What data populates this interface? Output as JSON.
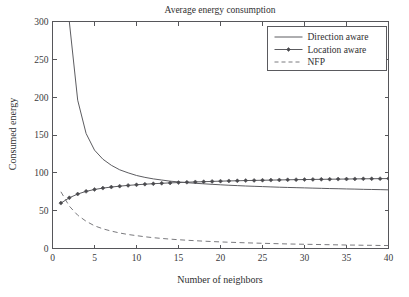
{
  "chart_data": {
    "type": "line",
    "title": "Average energy consumption",
    "xlabel": "Number of neighbors",
    "ylabel": "Consumed energy",
    "xlim": [
      0,
      40
    ],
    "ylim": [
      0,
      300
    ],
    "xticks": [
      0,
      5,
      10,
      15,
      20,
      25,
      30,
      35,
      40
    ],
    "yticks": [
      0,
      50,
      100,
      150,
      200,
      250,
      300
    ],
    "grid": false,
    "legend_position": "top-right",
    "x": [
      1,
      2,
      3,
      4,
      5,
      6,
      7,
      8,
      9,
      10,
      11,
      12,
      13,
      14,
      15,
      16,
      17,
      18,
      19,
      20,
      21,
      22,
      23,
      24,
      25,
      26,
      27,
      28,
      29,
      30,
      31,
      32,
      33,
      34,
      35,
      36,
      37,
      38,
      39,
      40
    ],
    "series": [
      {
        "name": "Direction aware",
        "style": "solid",
        "marker": "none",
        "color": "#5c5c60",
        "values": [
          600,
          300,
          196,
          152,
          130,
          118,
          110,
          104,
          100,
          96.5,
          94,
          92,
          90.5,
          89,
          88,
          87,
          86.2,
          85.5,
          84.8,
          84.2,
          83.6,
          83.1,
          82.6,
          82.2,
          81.8,
          81.4,
          81.0,
          80.7,
          80.4,
          80.1,
          79.8,
          79.5,
          79.2,
          79.0,
          78.7,
          78.5,
          78.2,
          78.0,
          77.8,
          77.5
        ]
      },
      {
        "name": "Location aware",
        "style": "solid",
        "marker": "diamond",
        "color": "#4a4a4e",
        "values": [
          60,
          67,
          72,
          75.5,
          78,
          79.8,
          81.2,
          82.4,
          83.4,
          84.2,
          85.0,
          85.6,
          86.2,
          86.7,
          87.1,
          87.6,
          88.0,
          88.3,
          88.7,
          89.0,
          89.3,
          89.5,
          89.8,
          90.0,
          90.2,
          90.4,
          90.6,
          90.8,
          91.0,
          91.1,
          91.3,
          91.4,
          91.6,
          91.7,
          91.8,
          92.0,
          92.1,
          92.2,
          92.3,
          92.4
        ]
      },
      {
        "name": "NFP",
        "style": "dashed",
        "marker": "none",
        "color": "#7a7a7e",
        "values": [
          75,
          56,
          44,
          36,
          30,
          26,
          23,
          20.5,
          18.5,
          17,
          15.5,
          14.3,
          13.3,
          12.4,
          11.6,
          10.9,
          10.3,
          9.7,
          9.2,
          8.7,
          8.3,
          7.9,
          7.5,
          7.2,
          6.9,
          6.6,
          6.3,
          6.0,
          5.8,
          5.6,
          5.4,
          5.2,
          5.0,
          4.8,
          4.6,
          4.5,
          4.3,
          4.2,
          4.0,
          3.9
        ]
      }
    ]
  }
}
